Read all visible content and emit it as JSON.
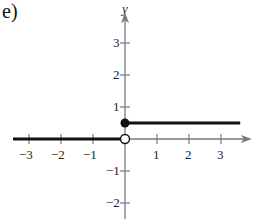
{
  "part_label": "e)",
  "chart_data": {
    "type": "line",
    "title": "",
    "xlabel": "",
    "ylabel": "y",
    "xlim": [
      -3.5,
      3.9
    ],
    "ylim": [
      -2.5,
      3.9
    ],
    "x_ticks": [
      -3,
      -2,
      -1,
      1,
      2,
      3
    ],
    "y_ticks": [
      -2,
      -1,
      1,
      2,
      3
    ],
    "x_tick_labels": [
      "−3",
      "−2",
      "−1",
      "1",
      "2",
      "3"
    ],
    "y_tick_labels": [
      "−2",
      "−1",
      "1",
      "2",
      "3"
    ],
    "grid": false,
    "series": [
      {
        "name": "f(x), x < 0",
        "x": [
          -3.5,
          0
        ],
        "y": [
          0,
          0
        ],
        "end": "open"
      },
      {
        "name": "f(x), x ≥ 0",
        "x": [
          0,
          3.6
        ],
        "y": [
          0.5,
          0.5
        ],
        "start": "closed"
      }
    ],
    "points": [
      {
        "x": 0,
        "y": 0.5,
        "style": "closed"
      },
      {
        "x": 0,
        "y": 0,
        "style": "open"
      }
    ]
  },
  "colors": {
    "axis": "#7a7a7a",
    "graph": "#111111",
    "text": "#222222"
  }
}
